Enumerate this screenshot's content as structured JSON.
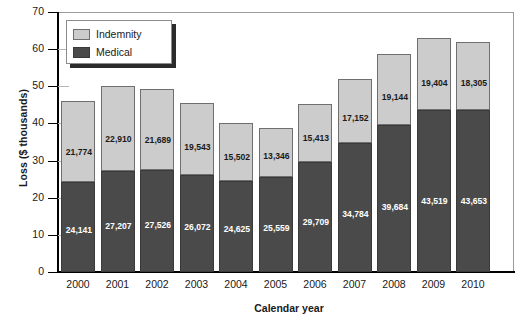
{
  "chart_data": {
    "type": "bar",
    "subtype": "stacked-vertical",
    "title": "",
    "xlabel": "Calendar year",
    "ylabel": "Loss ($ thousands)",
    "categories": [
      "2000",
      "2001",
      "2002",
      "2003",
      "2004",
      "2005",
      "2006",
      "2007",
      "2008",
      "2009",
      "2010"
    ],
    "series": [
      {
        "name": "Medical",
        "color": "#4a4a4a",
        "values": [
          24141,
          27207,
          27526,
          26072,
          24625,
          25559,
          29709,
          34784,
          39684,
          43519,
          43653
        ],
        "labels": [
          "24,141",
          "27,207",
          "27,526",
          "26,072",
          "24,625",
          "25,559",
          "29,709",
          "34,784",
          "39,684",
          "43,519",
          "43,653"
        ]
      },
      {
        "name": "Indemnity",
        "color": "#cccccc",
        "values": [
          21774,
          22910,
          21689,
          19543,
          15502,
          13346,
          15413,
          17152,
          19144,
          19404,
          18305
        ],
        "labels": [
          "21,774",
          "22,910",
          "21,689",
          "19,543",
          "15,502",
          "13,346",
          "15,413",
          "17,152",
          "19,144",
          "19,404",
          "18,305"
        ]
      }
    ],
    "totals": [
      45915,
      50117,
      49215,
      45615,
      40127,
      38905,
      45122,
      51936,
      58828,
      62923,
      61958
    ],
    "ylim": [
      0,
      70
    ],
    "yticks": [
      0,
      10,
      20,
      30,
      40,
      50,
      60,
      70
    ],
    "ytick_labels": [
      "0",
      "10",
      "20",
      "30",
      "40",
      "50",
      "60",
      "70"
    ],
    "grid": false,
    "legend_position": "upper-left",
    "value_unit": "dollars",
    "value_scale": "thousands"
  },
  "legend": {
    "items": [
      {
        "label": "Indemnity",
        "swatch": "indemnity"
      },
      {
        "label": "Medical",
        "swatch": "medical"
      }
    ]
  },
  "axes": {
    "y_title": "Loss ($ thousands)",
    "x_title": "Calendar year"
  }
}
